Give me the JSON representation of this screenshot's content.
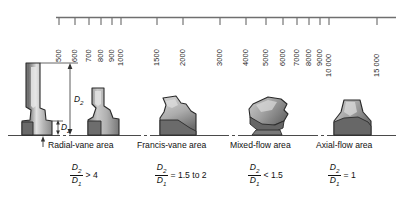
{
  "figure": {
    "axis": {
      "type": "log",
      "orientation": "horizontal-top",
      "tick_labels": [
        "500",
        "600",
        "700",
        "800",
        "900",
        "1000",
        "1500",
        "2000",
        "3000",
        "4000",
        "5000",
        "6000",
        "7000",
        "8000",
        "9000",
        "10 000",
        "15 000"
      ],
      "tick_values": [
        500,
        600,
        700,
        800,
        900,
        1000,
        1500,
        2000,
        3000,
        4000,
        5000,
        6000,
        7000,
        8000,
        9000,
        10000,
        15000
      ],
      "min": 460,
      "max": 17000,
      "line_color": "#6f6f6f"
    },
    "dimension_labels": {
      "large": "D",
      "large_sub": "2",
      "small": "D",
      "small_sub": "2"
    },
    "areas": [
      {
        "label": "Radial-vane area"
      },
      {
        "label": "Francis-vane area"
      },
      {
        "label": "Mixed-flow area"
      },
      {
        "label": "Axial-flow area"
      }
    ],
    "ratios": [
      {
        "numerator": "D",
        "numerator_sub": "2",
        "denominator": "D",
        "denominator_sub": "1",
        "relation": "> 4"
      },
      {
        "numerator": "D",
        "numerator_sub": "2",
        "denominator": "D",
        "denominator_sub": "1",
        "relation": "= 1.5 to 2"
      },
      {
        "numerator": "D",
        "numerator_sub": "2",
        "denominator": "D",
        "denominator_sub": "1",
        "relation": "< 1.5"
      },
      {
        "numerator": "D",
        "numerator_sub": "2",
        "denominator": "D",
        "denominator_sub": "1",
        "relation": "= 1"
      }
    ],
    "runners": [
      {
        "name": "radial-vane-runner"
      },
      {
        "name": "francis-vane-runner"
      },
      {
        "name": "mixed-flow-runner"
      },
      {
        "name": "axial-flow-runner"
      }
    ],
    "colors": {
      "shape_light": "#d4d4d4",
      "shape_mid": "#a8a8a8",
      "shape_dark": "#6e6e6e",
      "outline": "#2a2a2a",
      "axis": "#6f6f6f",
      "text": "#111111"
    }
  }
}
